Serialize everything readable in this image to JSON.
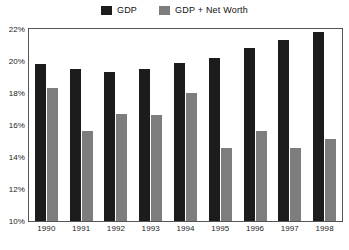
{
  "legend": {
    "position": "top-center",
    "entries": [
      {
        "label": "GDP",
        "color": "#1c1c1c",
        "swatch_name": "legend-swatch-gdp"
      },
      {
        "label": "GDP + Net Worth",
        "color": "#7d7d7d",
        "swatch_name": "legend-swatch-gdp-net-worth"
      }
    ]
  },
  "axes": {
    "y_ticks": [
      "10%",
      "12%",
      "14%",
      "16%",
      "18%",
      "20%",
      "22%"
    ],
    "y_tick_values": [
      10,
      12,
      14,
      16,
      18,
      20,
      22
    ],
    "x_ticks": [
      "1990",
      "1991",
      "1992",
      "1993",
      "1994",
      "1995",
      "1996",
      "1997",
      "1998"
    ]
  },
  "colors": {
    "gdp": "#1c1c1c",
    "gdp_net_worth": "#7d7d7d",
    "frame": "#555555",
    "text": "#222222",
    "background": "#ffffff"
  },
  "chart_data": {
    "type": "bar",
    "title": "",
    "subtitle": "",
    "xlabel": "",
    "ylabel": "",
    "ylim": [
      10,
      22
    ],
    "y_tick_step": 2,
    "y_tick_format": "percent",
    "grid": false,
    "legend_position": "top-center",
    "categories": [
      "1990",
      "1991",
      "1992",
      "1993",
      "1994",
      "1995",
      "1996",
      "1997",
      "1998"
    ],
    "series": [
      {
        "name": "GDP",
        "color": "#1c1c1c",
        "values": [
          19.8,
          19.5,
          19.3,
          19.5,
          19.9,
          20.2,
          20.8,
          21.3,
          21.8
        ]
      },
      {
        "name": "GDP + Net Worth",
        "color": "#7d7d7d",
        "values": [
          18.3,
          15.6,
          16.7,
          16.6,
          18.0,
          14.55,
          15.6,
          14.55,
          15.1
        ]
      }
    ],
    "annotations": []
  }
}
